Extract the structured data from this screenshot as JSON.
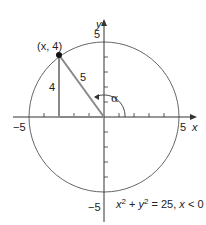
{
  "diagram": {
    "type": "unit-circle-radius-5",
    "axes": {
      "x_label": "x",
      "y_label": "y",
      "x_pos_tick": "5",
      "x_neg_tick": "−5",
      "y_pos_tick": "5",
      "y_neg_tick": "−5"
    },
    "point": {
      "label": "(x, 4)",
      "x": -3,
      "y": 4
    },
    "triangle": {
      "vertical_side_label": "4",
      "hypotenuse_label": "5"
    },
    "angle_label": "α",
    "equation": {
      "prefix_x": "x",
      "sup1": "2",
      "plus": " + ",
      "prefix_y": "y",
      "sup2": "2",
      "rest": " = 25, ",
      "cond_x": "x",
      "cond": " < 0"
    },
    "colors": {
      "axis": "#333333",
      "circle": "#555555",
      "triangle": "#888888",
      "point": "#111111"
    }
  }
}
